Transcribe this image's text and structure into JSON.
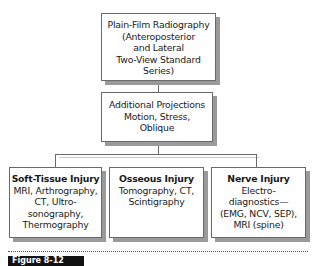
{
  "diagram": {
    "top_box": {
      "lines": [
        "Plain-Film Radiography",
        "(Anteroposterior",
        "and Lateral",
        "Two-View Standard",
        "Series)"
      ]
    },
    "middle_box": {
      "lines": [
        "Additional Projections",
        "Motion, Stress,",
        "Oblique"
      ]
    },
    "bottom_boxes": [
      {
        "title": "Soft-Tissue Injury",
        "lines": [
          "MRI, Arthrography,",
          "CT, Ultro-",
          "sonography,",
          "Thermography"
        ]
      },
      {
        "title": "Osseous Injury",
        "lines": [
          "Tomography, CT,",
          "Scintigraphy"
        ]
      },
      {
        "title": "Nerve Injury",
        "lines": [
          "Electro-",
          "diagnostics—",
          "(EMG, NCV, SEP),",
          "MRI (spine)"
        ]
      }
    ]
  },
  "caption": {
    "label": "Figure 8-12",
    "text": ""
  }
}
